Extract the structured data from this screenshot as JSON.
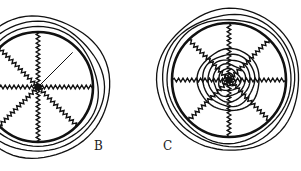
{
  "figure": {
    "panels": [
      {
        "id": "B",
        "label": "B",
        "description": "Orb web with zigzag radii and one straight radius, concentric outer frame rings",
        "center": [
          38,
          87
        ],
        "hub_radius": 55,
        "frame_rings": [
          60,
          65,
          71
        ],
        "radii_count": 8,
        "spiral_rings": []
      },
      {
        "id": "C",
        "label": "C",
        "description": "Orb web with zigzag radii and concentric spiral rings around the hub",
        "center": [
          229,
          80
        ],
        "hub_radius": 57,
        "frame_rings": [
          62,
          66,
          71
        ],
        "radii_count": 8,
        "spiral_rings": [
          6,
          11,
          16,
          21,
          26,
          31
        ]
      }
    ]
  }
}
